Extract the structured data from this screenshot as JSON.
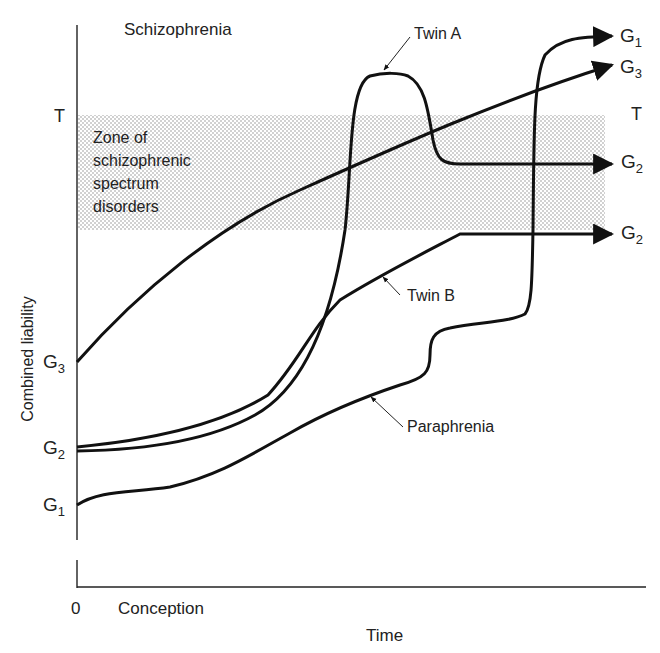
{
  "figure": {
    "region_label": "Schizophrenia",
    "zone_label_lines": [
      "Zone of",
      "schizophrenic",
      "spectrum",
      "disorders"
    ],
    "y_axis_label": "Combined liability",
    "x_axis_label": "Time",
    "x_origin_label": "0",
    "x_start_label": "Conception",
    "threshold_left": "T",
    "threshold_right": "T",
    "left_ticks": [
      {
        "base": "G",
        "sub": "3"
      },
      {
        "base": "G",
        "sub": "2"
      },
      {
        "base": "G",
        "sub": "1"
      }
    ],
    "right_endpoints": [
      {
        "base": "G",
        "sub": "1"
      },
      {
        "base": "G",
        "sub": "3"
      },
      {
        "base": "G",
        "sub": "2"
      },
      {
        "base": "G",
        "sub": "2"
      }
    ],
    "curve_annotations": {
      "twin_a": "Twin A",
      "twin_b": "Twin B",
      "paraphrenia": "Paraphrenia"
    },
    "colors": {
      "line": "#111111",
      "zone_stipple": "#9a9a9a",
      "background": "#ffffff"
    }
  }
}
